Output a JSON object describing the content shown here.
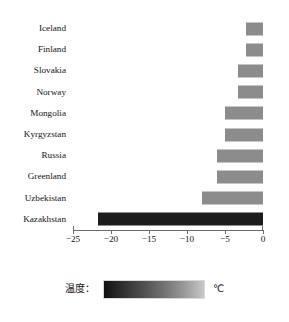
{
  "chart_data": {
    "type": "bar",
    "orientation": "horizontal",
    "title": "",
    "xlabel": "",
    "ylabel": "",
    "categories": [
      "Iceland",
      "Finland",
      "Slovakia",
      "Norway",
      "Mongolia",
      "Kyrgyzstan",
      "Russia",
      "Greenland",
      "Uzbekistan",
      "Kazakhstan"
    ],
    "values": [
      -2.3,
      -2.3,
      -3.3,
      -3.3,
      -5.0,
      -5.0,
      -6.0,
      -6.0,
      -8.0,
      -21.7
    ],
    "xlim": [
      -25,
      0
    ],
    "xticks": [
      -25,
      -20,
      -15,
      -10,
      -5,
      0
    ],
    "xtick_labels": [
      "−25",
      "−20",
      "−15",
      "−10",
      "−5",
      "0"
    ],
    "grid": false,
    "legend_position": "bottom",
    "bar_colors": [
      "#8c8c8c",
      "#8c8c8c",
      "#8c8c8c",
      "#8c8c8c",
      "#8c8c8c",
      "#8c8c8c",
      "#8c8c8c",
      "#8c8c8c",
      "#8c8c8c",
      "#1c1c1c"
    ],
    "colormap": {
      "name": "temperature-gray",
      "from": "#111111",
      "to": "#c9c9c9"
    },
    "legend": {
      "label": "温度：",
      "unit": "℃"
    }
  },
  "colors": {
    "bar_gray": "#8c8c8c",
    "bar_dark": "#1c1c1c",
    "axis": "#6b6b6b",
    "text": "#141414",
    "background": "#ffffff"
  }
}
